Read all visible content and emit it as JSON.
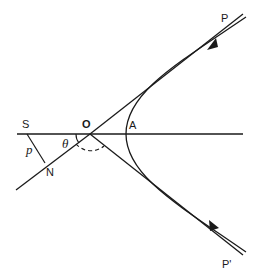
{
  "diagram": {
    "labels": {
      "P": "P",
      "P_prime": "P'",
      "O": "O",
      "A": "A",
      "S": "S",
      "N": "N",
      "p": "p",
      "theta": "θ"
    },
    "colors": {
      "line": "#1a1a1a",
      "background": "#ffffff"
    }
  }
}
